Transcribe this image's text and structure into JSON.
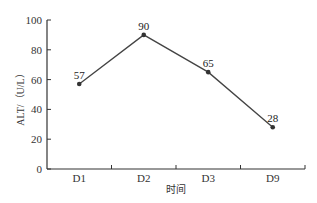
{
  "chart_data": {
    "type": "line",
    "title": "",
    "xlabel": "时间",
    "ylabel": "ALT/（U/L）",
    "categories": [
      "D1",
      "D2",
      "D3",
      "D9"
    ],
    "series": [
      {
        "name": "ALT",
        "values": [
          57,
          90,
          65,
          28
        ]
      }
    ],
    "data_labels": [
      "57",
      "90",
      "65",
      "28"
    ],
    "ylim": [
      0,
      100
    ],
    "yticks": [
      0,
      20,
      40,
      60,
      80,
      100
    ],
    "grid": false,
    "legend": null,
    "colors": {
      "line": "#444444",
      "marker": "#333333",
      "axis": "#333333"
    }
  }
}
